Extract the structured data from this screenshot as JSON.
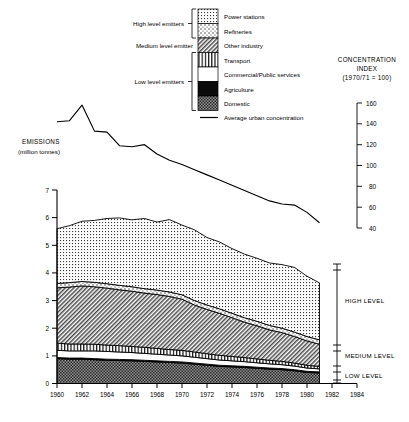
{
  "chart_data": {
    "type": "area",
    "title": "",
    "ylabel": "EMISSIONS",
    "ylabel_unit": "(million tonnes)",
    "xlabel": "",
    "ylim": [
      0,
      7
    ],
    "yticks": [
      "0",
      "1",
      "2",
      "3",
      "4",
      "5",
      "6",
      "7"
    ],
    "xticks": [
      "1960",
      "1962",
      "1964",
      "1966",
      "1968",
      "1970",
      "1972",
      "1974",
      "1976",
      "1978",
      "1980",
      "1982",
      "1984"
    ],
    "xlim": [
      1960,
      1984
    ],
    "grid": false,
    "x": [
      1960,
      1961,
      1962,
      1963,
      1964,
      1965,
      1966,
      1967,
      1968,
      1969,
      1970,
      1971,
      1972,
      1973,
      1974,
      1975,
      1976,
      1977,
      1978,
      1979,
      1980,
      1981
    ],
    "series": [
      {
        "name": "Domestic",
        "pattern": "coarse-dot-dark",
        "values": [
          0.9,
          0.88,
          0.88,
          0.86,
          0.84,
          0.83,
          0.82,
          0.8,
          0.78,
          0.76,
          0.74,
          0.7,
          0.66,
          0.62,
          0.6,
          0.58,
          0.55,
          0.52,
          0.5,
          0.46,
          0.4,
          0.38
        ]
      },
      {
        "name": "Agriculture",
        "pattern": "solid-black",
        "values": [
          0.04,
          0.04,
          0.04,
          0.04,
          0.04,
          0.04,
          0.04,
          0.04,
          0.04,
          0.04,
          0.04,
          0.04,
          0.04,
          0.04,
          0.04,
          0.04,
          0.04,
          0.04,
          0.04,
          0.04,
          0.04,
          0.04
        ]
      },
      {
        "name": "Commercial/Public services",
        "pattern": "white",
        "values": [
          0.26,
          0.26,
          0.26,
          0.28,
          0.28,
          0.27,
          0.26,
          0.25,
          0.24,
          0.23,
          0.22,
          0.21,
          0.2,
          0.19,
          0.18,
          0.17,
          0.16,
          0.15,
          0.14,
          0.13,
          0.12,
          0.11
        ]
      },
      {
        "name": "Transport",
        "pattern": "vertical-lines",
        "values": [
          0.26,
          0.25,
          0.25,
          0.24,
          0.23,
          0.23,
          0.22,
          0.22,
          0.21,
          0.2,
          0.2,
          0.19,
          0.18,
          0.17,
          0.16,
          0.15,
          0.14,
          0.13,
          0.12,
          0.11,
          0.1,
          0.09
        ]
      },
      {
        "name": "Other industry",
        "pattern": "diagonal-hatch",
        "values": [
          2.0,
          2.06,
          2.1,
          2.08,
          2.06,
          2.02,
          2.0,
          1.96,
          1.95,
          1.92,
          1.85,
          1.7,
          1.6,
          1.52,
          1.4,
          1.28,
          1.2,
          1.1,
          1.04,
          0.96,
          0.88,
          0.8
        ]
      },
      {
        "name": "Refineries",
        "pattern": "sparse-dots",
        "values": [
          0.16,
          0.16,
          0.16,
          0.16,
          0.16,
          0.16,
          0.16,
          0.16,
          0.16,
          0.16,
          0.16,
          0.16,
          0.16,
          0.16,
          0.16,
          0.16,
          0.16,
          0.16,
          0.16,
          0.16,
          0.16,
          0.16
        ]
      },
      {
        "name": "Power stations",
        "pattern": "fine-dot-grid",
        "values": [
          1.98,
          2.06,
          2.18,
          2.24,
          2.36,
          2.44,
          2.42,
          2.54,
          2.46,
          2.62,
          2.52,
          2.56,
          2.44,
          2.42,
          2.34,
          2.3,
          2.28,
          2.26,
          2.3,
          2.34,
          2.18,
          2.06
        ]
      }
    ],
    "concentration_line": {
      "name": "Average urban concentration",
      "axis": "right",
      "ylim": [
        40,
        160
      ],
      "yticks": [
        "160",
        "140",
        "120",
        "100",
        "80",
        "60",
        "40"
      ],
      "axis_title": "CONCENTRATION",
      "axis_title2": "INDEX",
      "axis_title3": "(1970/71 = 100)",
      "x": [
        1960,
        1961,
        1962,
        1963,
        1964,
        1965,
        1966,
        1967,
        1968,
        1969,
        1970,
        1971,
        1972,
        1973,
        1974,
        1975,
        1976,
        1977,
        1978,
        1979,
        1980,
        1981
      ],
      "values": [
        142,
        143,
        158,
        133,
        132,
        119,
        118,
        120,
        111,
        105,
        101,
        96,
        91,
        86,
        81,
        76,
        71,
        66,
        63,
        62,
        55,
        45
      ]
    }
  },
  "legend": {
    "groups": [
      {
        "label": "High level emitters"
      },
      {
        "label": "Medium level emitter"
      },
      {
        "label": "Low level emitters"
      }
    ],
    "items": [
      {
        "label": "Power stations",
        "pattern": "fine-dot-grid"
      },
      {
        "label": "Refineries",
        "pattern": "sparse-dots"
      },
      {
        "label": "Other industry",
        "pattern": "diagonal-hatch"
      },
      {
        "label": "Transport",
        "pattern": "vertical-lines"
      },
      {
        "label": "Commercial/Public services",
        "pattern": "white"
      },
      {
        "label": "Agriculture",
        "pattern": "solid-black"
      },
      {
        "label": "Domestic",
        "pattern": "coarse-dot-dark"
      }
    ],
    "line_item": {
      "label": "Average urban concentration"
    }
  },
  "level_markers": [
    {
      "label": "HIGH LEVEL"
    },
    {
      "label": "MEDIUM LEVEL"
    },
    {
      "label": "LOW LEVEL"
    }
  ]
}
